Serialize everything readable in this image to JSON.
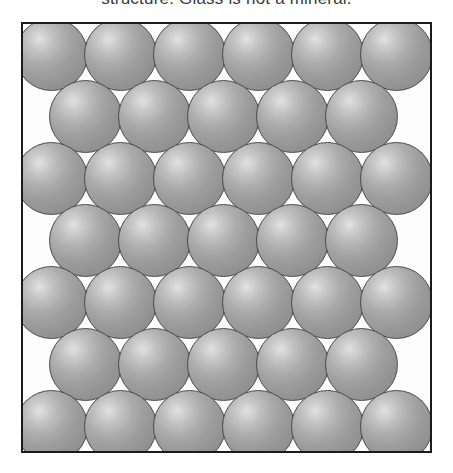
{
  "caption": {
    "text": "structure. Glass is not a mineral.",
    "clipped": true
  },
  "figure": {
    "name": "ordered-atomic-structure",
    "frame": {
      "x": 21,
      "y": 22,
      "width": 411,
      "height": 431,
      "border_color": "#1b1b1b",
      "border_width": 2,
      "background_color": "#fdfdfd"
    },
    "sphere_style": {
      "diameter": 73,
      "highlight_color": "#e2e2e2",
      "mid_color": "#9d9d9d",
      "shadow_color": "#7e7e7e",
      "outline_color": "#4a4a4a"
    },
    "lattice": {
      "type": "close-packed",
      "rows": 7,
      "row_counts": [
        6,
        5,
        6,
        5,
        6,
        5,
        6
      ],
      "row_offsets": [
        0,
        1,
        0,
        1,
        0,
        1,
        0
      ],
      "row_spacing": 62,
      "column_spacing": 69,
      "first_row_y": -6,
      "first_column_x": -8,
      "offset_x": 34,
      "total_spheres": 39
    }
  }
}
